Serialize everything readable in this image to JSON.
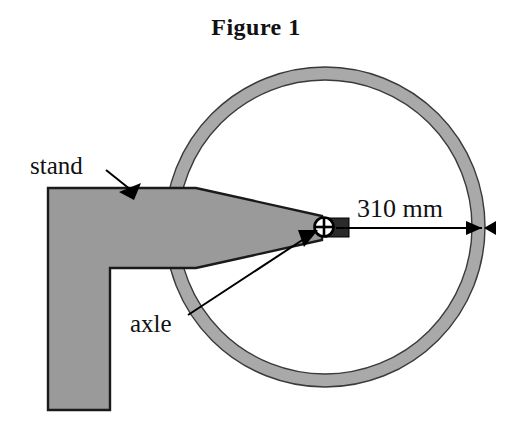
{
  "figure": {
    "title": "Figure 1",
    "caption_position": "top-center"
  },
  "labels": {
    "stand": "stand",
    "axle": "axle",
    "dimension": "310 mm"
  },
  "colors": {
    "rim_fill": "#a9a9a9",
    "rim_stroke": "#3a3a3a",
    "stand_fill": "#9a9a9a",
    "stand_stroke": "#1a1a1a",
    "spoke_stroke": "#b5b5b5",
    "hub_fill": "#2b2b2b",
    "text": "#111111",
    "background": "#ffffff",
    "leader_line": "#000000"
  },
  "geometry": {
    "wheel": {
      "center_x": 325,
      "center_y": 227,
      "outer_radius": 160,
      "inner_radius": 147,
      "spoke_count": 34
    },
    "axle_hub": {
      "x": 325,
      "y": 227,
      "width": 36,
      "height": 20
    },
    "dimension_line": {
      "from_x": 333,
      "to_x": 485,
      "y": 228,
      "value": "310 mm",
      "arrow_ends": "both"
    },
    "stand": {
      "column_left": 48,
      "column_right": 110,
      "column_bottom": 410,
      "arm_top": 188,
      "arm_tip_x": 322
    }
  }
}
